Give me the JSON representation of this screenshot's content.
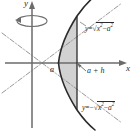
{
  "figure": {
    "type": "math-diagram",
    "background_color": "#ffffff",
    "curve_color": "#2b2b2b",
    "axis_color": "#6b6b6b",
    "asymptote_color": "#8a8a8a",
    "shade_color": "#d2d2d2",
    "axes": {
      "x_label": "x",
      "y_label": "y",
      "origin": {
        "x": 32,
        "y": 63
      }
    },
    "points": {
      "vertex_label": "a",
      "right_bound_label": "a + h"
    },
    "equations": {
      "upper": {
        "lhs": "y",
        "eq": "=",
        "radicand_x": "x",
        "exp_x": "2",
        "minus": "−",
        "radicand_a": "a",
        "exp_a": "2",
        "sign": ""
      },
      "lower": {
        "lhs": "y",
        "eq": "=",
        "radicand_x": "x",
        "exp_x": "2",
        "minus": "−",
        "radicand_a": "a",
        "exp_a": "2",
        "sign": "−"
      }
    },
    "revolution": {
      "indicator": "rotation-ellipse-about-y-axis"
    }
  }
}
